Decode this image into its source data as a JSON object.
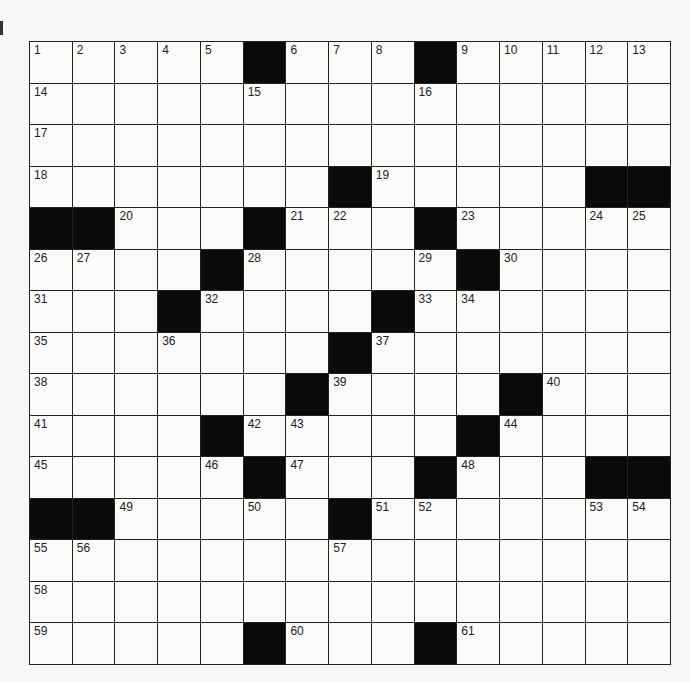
{
  "puzzle": {
    "rows": 15,
    "cols": 15,
    "colors": {
      "black": "#0a0a0a",
      "white": "#fbfbf9",
      "line": "#222222"
    },
    "layout": [
      "1,2,3,4,5,#,6,7,8,#,9,10,11,12,13",
      "14,.,.,.,.,15,.,.,.,16,.,.,.,.,.",
      "17,.,.,.,.,.,.,.,.,.,.,.,.,.,.",
      "18,.,.,.,.,.,.,#,19,.,.,.,.,#,#",
      "#,#,20,.,.,#,21,22,.,#,23,.,.,24,25",
      "26,27,.,.,#,28,.,.,.,29,#,30,.,.,.",
      "31,.,.,#,32,.,.,.,#,33,34,.,.,.,.",
      "35,.,.,36,.,.,.,#,37,.,.,.,.,.,.",
      "38,.,.,.,.,.,#,39,.,.,.,#,40,.,.",
      "41,.,.,.,#,42,43,.,.,.,#,44,.,.,.",
      "45,.,.,.,46,#,47,.,.,#,48,.,.,#,#",
      "#,#,49,.,.,50,.,#,51,52,.,.,.,53,54",
      "55,56,.,.,.,.,.,57,.,.,.,.,.,.,.",
      "58,.,.,.,.,.,.,.,.,.,.,.,.,.,.",
      "59,.,.,.,.,#,60,.,.,#,61,.,.,.,."
    ]
  }
}
